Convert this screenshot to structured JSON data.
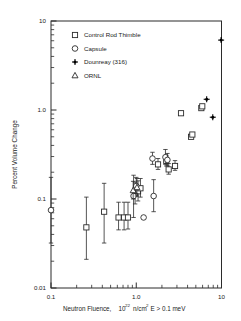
{
  "chart_data": {
    "type": "scatter",
    "title": "",
    "xlabel": "Neutron Fluence, 10^22 n/cm2 E > 0.1 meV",
    "xlabel_parts": {
      "lead": "Neutron Fluence,",
      "base": "10",
      "exp": "22",
      "unit_a": "n/cm",
      "unit_exp": "2",
      "unit_b": "E > 0.1 meV"
    },
    "ylabel": "Percent Volume Change",
    "xscale": "log",
    "yscale": "log",
    "xlim": [
      0.1,
      10
    ],
    "ylim": [
      0.01,
      10
    ],
    "xticks": [
      0.1,
      1.0,
      10
    ],
    "xticklabels": [
      "0.1",
      "1.0",
      "10"
    ],
    "yticks": [
      0.01,
      0.1,
      1.0,
      10
    ],
    "yticklabels": [
      "0.01",
      "0.1",
      "1.0",
      "10"
    ],
    "grid": false,
    "legend_position": "upper-left-inside",
    "series": [
      {
        "name": "Control Rod Thimble",
        "marker": "open-square",
        "points": [
          {
            "x": 0.26,
            "y": 0.048,
            "yerr_low": 0.021,
            "yerr_high": 0.105
          },
          {
            "x": 0.42,
            "y": 0.072,
            "yerr_low": 0.032,
            "yerr_high": 0.15
          },
          {
            "x": 0.62,
            "y": 0.062,
            "yerr_low": 0.045,
            "yerr_high": 0.092
          },
          {
            "x": 0.72,
            "y": 0.062,
            "yerr_low": 0.045,
            "yerr_high": 0.092
          },
          {
            "x": 0.8,
            "y": 0.062,
            "yerr_low": 0.046,
            "yerr_high": 0.092
          },
          {
            "x": 0.97,
            "y": 0.115,
            "yerr_low": 0.088,
            "yerr_high": 0.155
          },
          {
            "x": 1.05,
            "y": 0.122,
            "yerr_low": 0.095,
            "yerr_high": 0.16
          },
          {
            "x": 1.12,
            "y": 0.132,
            "yerr_low": 0.105,
            "yerr_high": 0.17
          },
          {
            "x": 1.8,
            "y": 0.245,
            "yerr_low": 0.215,
            "yerr_high": 0.285
          },
          {
            "x": 2.25,
            "y": 0.268,
            "yerr_low": 0.235,
            "yerr_high": 0.31
          },
          {
            "x": 2.4,
            "y": 0.215,
            "yerr_low": 0.19,
            "yerr_high": 0.25
          },
          {
            "x": 2.85,
            "y": 0.235,
            "yerr_low": 0.21,
            "yerr_high": 0.27
          },
          {
            "x": 3.35,
            "y": 0.92
          },
          {
            "x": 4.4,
            "y": 0.5
          },
          {
            "x": 4.55,
            "y": 0.53
          },
          {
            "x": 5.8,
            "y": 1.05
          },
          {
            "x": 5.95,
            "y": 1.1
          }
        ]
      },
      {
        "name": "Capsule",
        "marker": "open-circle",
        "points": [
          {
            "x": 0.1,
            "y": 0.075,
            "yerr_low": 0.032,
            "yerr_high": 0.175
          },
          {
            "x": 0.93,
            "y": 0.108,
            "yerr_low": 0.062,
            "yerr_high": 0.185
          },
          {
            "x": 1.22,
            "y": 0.062,
            "yerr_low": 0.062,
            "yerr_high": 0.062
          },
          {
            "x": 1.55,
            "y": 0.285,
            "yerr_low": 0.245,
            "yerr_high": 0.335
          },
          {
            "x": 1.6,
            "y": 0.108,
            "yerr_low": 0.072,
            "yerr_high": 0.165
          },
          {
            "x": 2.2,
            "y": 0.295,
            "yerr_low": 0.245,
            "yerr_high": 0.36
          },
          {
            "x": 2.32,
            "y": 0.275,
            "yerr_low": 0.235,
            "yerr_high": 0.325
          },
          {
            "x": 1.0,
            "y": 0.14,
            "yerr_low": 0.115,
            "yerr_high": 0.175
          }
        ]
      },
      {
        "name": "Dounreay (316)",
        "marker": "filled-star",
        "points": [
          {
            "x": 6.7,
            "y": 1.32
          },
          {
            "x": 7.9,
            "y": 0.83
          },
          {
            "x": 9.9,
            "y": 6.1
          }
        ]
      },
      {
        "name": "ORNL",
        "marker": "open-triangle",
        "points": [
          {
            "x": 0.92,
            "y": 0.125,
            "yerr_low": 0.1,
            "yerr_high": 0.158
          },
          {
            "x": 1.02,
            "y": 0.135,
            "yerr_low": 0.108,
            "yerr_high": 0.17
          }
        ]
      }
    ]
  },
  "legend": {
    "entries": [
      {
        "label": "Control Rod Thimble",
        "marker": "open-square"
      },
      {
        "label": "Capsule",
        "marker": "open-circle"
      },
      {
        "label": "Dounreay (316)",
        "marker": "filled-star"
      },
      {
        "label": "ORNL",
        "marker": "open-triangle"
      }
    ]
  }
}
